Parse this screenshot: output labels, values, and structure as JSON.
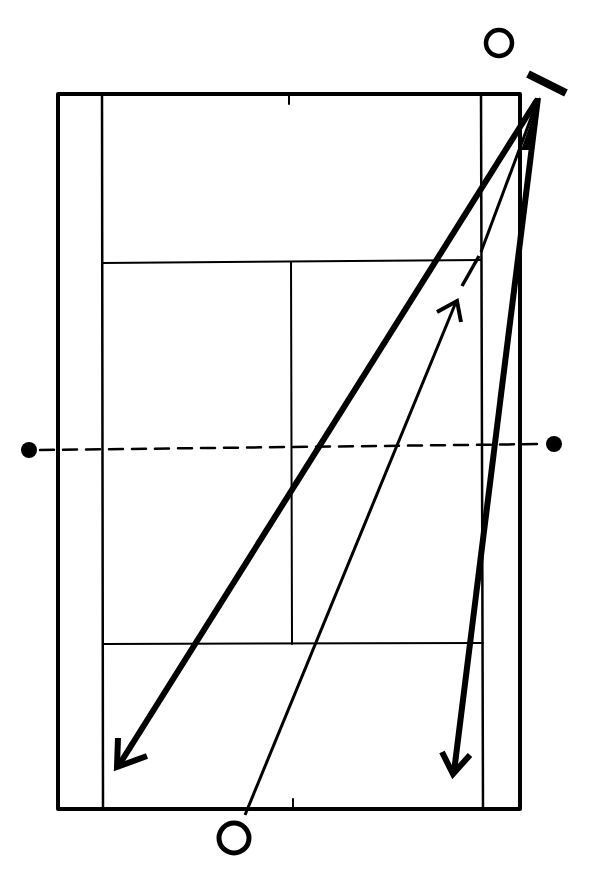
{
  "diagram": {
    "type": "tennis-court-shot-diagram",
    "background": "#ffffff",
    "ink": "#000000",
    "court": {
      "outer": {
        "x1": 58,
        "y1": 94,
        "x2": 520,
        "y2": 809
      },
      "singles_left_x": 102,
      "singles_right_x": 482,
      "top_service_y": 262,
      "bottom_service_y": 644,
      "center_x": 291,
      "net_y_left": 450,
      "net_y_right": 444,
      "post_left": {
        "x": 29,
        "y": 450
      },
      "post_right": {
        "x": 554,
        "y": 444
      }
    },
    "players": [
      {
        "name": "player-top",
        "x": 499,
        "y": 43,
        "r": 14
      },
      {
        "name": "player-bottom",
        "x": 234,
        "y": 838,
        "r": 16
      }
    ],
    "racket": {
      "x1": 528,
      "y1": 74,
      "x2": 566,
      "y2": 93
    },
    "shots": [
      {
        "name": "crosscourt-shot",
        "from": [
          537,
          100
        ],
        "to": [
          117,
          767
        ],
        "weight": "thick"
      },
      {
        "name": "downline-shot",
        "from": [
          537,
          100
        ],
        "to": [
          453,
          774
        ],
        "weight": "thick"
      },
      {
        "name": "incoming-shot",
        "from": [
          245,
          815
        ],
        "to": [
          457,
          301
        ],
        "weight": "thin"
      }
    ]
  }
}
